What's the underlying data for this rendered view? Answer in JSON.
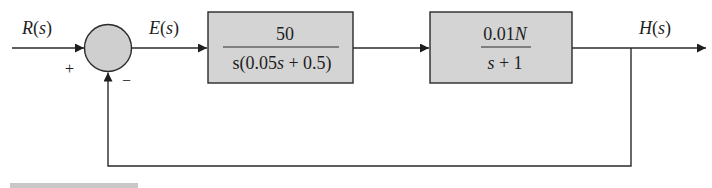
{
  "diagram": {
    "type": "feedback-control-block-diagram",
    "colors": {
      "block_fill": "#d4d4d4",
      "summing_fill": "#cfcfcf",
      "line": "#2a2a2a",
      "text": "#1e1e1e"
    },
    "signals": {
      "input": {
        "label": "R(s)"
      },
      "error": {
        "label": "E(s)"
      },
      "output": {
        "label": "H(s)"
      }
    },
    "summing_junction": {
      "plus_sign": "+",
      "minus_sign": "−"
    },
    "blocks": [
      {
        "id": "controller",
        "numerator": "50",
        "denominator": "s(0.05s + 0.5)"
      },
      {
        "id": "plant",
        "numerator": "0.01N",
        "denominator": "s + 1"
      }
    ],
    "feedback": {
      "type": "unity",
      "sign": "negative"
    }
  }
}
